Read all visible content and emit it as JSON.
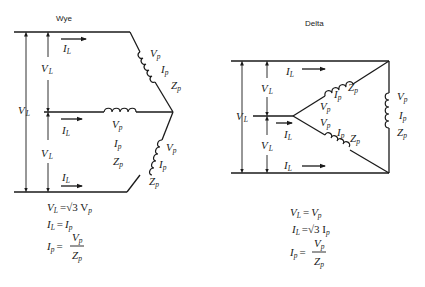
{
  "wye": {
    "title": "Wye",
    "labels": {
      "line_voltage": "V",
      "line_voltage_sub": "L",
      "line_current": "I",
      "line_current_sub": "L",
      "phase_voltage": "V",
      "phase_current": "I",
      "phase_impedance": "Z",
      "phase_sub": "p"
    },
    "equations": [
      {
        "lhs": "V",
        "lhs_sub": "L",
        "op": "=",
        "rhs": "√3 V",
        "rhs_sub": "p"
      },
      {
        "lhs": "I",
        "lhs_sub": "L",
        "op": "=",
        "rhs": "I",
        "rhs_sub": "p"
      },
      {
        "lhs": "I",
        "lhs_sub": "p",
        "op": "=",
        "num": "V",
        "num_sub": "p",
        "den": "Z",
        "den_sub": "p"
      }
    ]
  },
  "delta": {
    "title": "Delta",
    "labels": {
      "line_voltage": "V",
      "line_voltage_sub": "L",
      "line_current": "I",
      "line_current_sub": "L",
      "phase_voltage": "V",
      "phase_current": "I",
      "phase_impedance": "Z",
      "phase_sub": "p"
    },
    "equations": [
      {
        "lhs": "V",
        "lhs_sub": "L",
        "op": "=",
        "rhs": "V",
        "rhs_sub": "p"
      },
      {
        "lhs": "I",
        "lhs_sub": "L",
        "op": "=",
        "rhs": "√3 I",
        "rhs_sub": "p"
      },
      {
        "lhs": "I",
        "lhs_sub": "p",
        "op": "=",
        "num": "V",
        "num_sub": "p",
        "den": "Z",
        "den_sub": "p"
      }
    ]
  }
}
